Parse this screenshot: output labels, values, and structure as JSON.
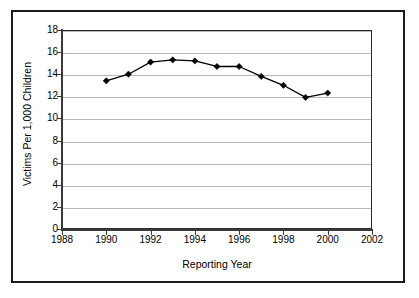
{
  "chart_data": {
    "type": "line",
    "title": "",
    "xlabel": "Reporting Year",
    "ylabel": "Victims Per 1,000 Children",
    "xlim": [
      1988,
      2002
    ],
    "ylim": [
      0,
      18
    ],
    "xticks": [
      1988,
      1990,
      1992,
      1994,
      1996,
      1998,
      2000,
      2002
    ],
    "yticks": [
      0,
      2,
      4,
      6,
      8,
      10,
      12,
      14,
      16,
      18
    ],
    "xtick_labels": [
      "1988",
      "1990",
      "1992",
      "1994",
      "1996",
      "1998",
      "2000",
      "2002"
    ],
    "ytick_labels": [
      "0",
      "2",
      "4",
      "6",
      "8",
      "10",
      "12",
      "14",
      "16",
      "18"
    ],
    "grid": "horizontal",
    "legend": "none",
    "marker": "diamond",
    "line_color": "#000000",
    "marker_color": "#000000",
    "gridline_color": "#b9b9b9",
    "axis_color": "#3a3a3a",
    "border_color": "#1a1a1a",
    "x": [
      1990,
      1991,
      1992,
      1993,
      1994,
      1995,
      1996,
      1997,
      1998,
      1999,
      2000
    ],
    "values": [
      13.4,
      14.0,
      15.1,
      15.3,
      15.2,
      14.7,
      14.7,
      13.8,
      13.0,
      11.9,
      12.3
    ],
    "series": [
      {
        "name": "Victims Per 1,000 Children",
        "values": [
          13.4,
          14.0,
          15.1,
          15.3,
          15.2,
          14.7,
          14.7,
          13.8,
          13.0,
          11.9,
          12.3
        ]
      }
    ]
  }
}
